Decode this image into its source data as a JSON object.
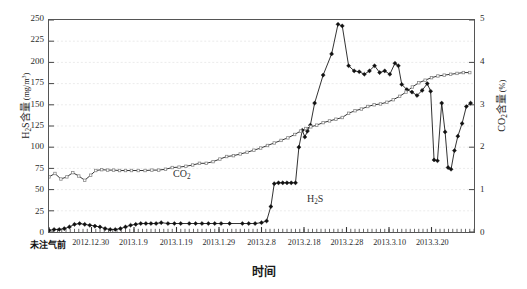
{
  "chart_data": {
    "type": "line",
    "title": "",
    "xlabel": "时间",
    "ylabel": "H₂S含量 (mg/m³)",
    "y2label": "CO₂含量 (%)",
    "grid": true,
    "legend_position": "in-plot-annotation",
    "ylim": [
      0,
      250
    ],
    "y2lim": [
      0,
      5
    ],
    "yticks": [
      0,
      25,
      50,
      75,
      100,
      125,
      150,
      175,
      200,
      225,
      250
    ],
    "y2ticks": [
      0,
      1,
      2,
      3,
      4,
      5
    ],
    "xtick_labels": [
      "未注气前",
      "2012.12.30",
      "2013.1.9",
      "2013.1.19",
      "2013.1.29",
      "2013.2.8",
      "2013.2.18",
      "2013.2.28",
      "2013.3.10",
      "2013.3.20"
    ],
    "xtick_positions": [
      0,
      10,
      20,
      30,
      40,
      50,
      60,
      70,
      80,
      90
    ],
    "x_range": [
      0,
      100
    ],
    "annotations": [
      {
        "text": "CO₂",
        "x": 18,
        "y": 120
      },
      {
        "text": "H₂S",
        "x": 50,
        "y": 60
      }
    ],
    "series": [
      {
        "name": "H₂S",
        "axis": "left",
        "unit": "mg/m³",
        "marker": "diamond-filled",
        "color": "#111111",
        "points": [
          {
            "x": 0.0,
            "y": 2
          },
          {
            "x": 1.2,
            "y": 3
          },
          {
            "x": 2.4,
            "y": 3
          },
          {
            "x": 3.6,
            "y": 4
          },
          {
            "x": 4.8,
            "y": 6
          },
          {
            "x": 6.0,
            "y": 9
          },
          {
            "x": 7.2,
            "y": 10
          },
          {
            "x": 8.4,
            "y": 9
          },
          {
            "x": 9.6,
            "y": 8
          },
          {
            "x": 10.8,
            "y": 7
          },
          {
            "x": 12.0,
            "y": 6
          },
          {
            "x": 13.2,
            "y": 4
          },
          {
            "x": 14.4,
            "y": 3
          },
          {
            "x": 15.6,
            "y": 3
          },
          {
            "x": 16.8,
            "y": 4
          },
          {
            "x": 18.0,
            "y": 6
          },
          {
            "x": 19.2,
            "y": 8
          },
          {
            "x": 20.4,
            "y": 9
          },
          {
            "x": 21.6,
            "y": 10
          },
          {
            "x": 22.8,
            "y": 10
          },
          {
            "x": 24.0,
            "y": 10
          },
          {
            "x": 25.2,
            "y": 10
          },
          {
            "x": 26.4,
            "y": 11
          },
          {
            "x": 28.0,
            "y": 10
          },
          {
            "x": 29.5,
            "y": 10
          },
          {
            "x": 31.0,
            "y": 10
          },
          {
            "x": 33.0,
            "y": 10
          },
          {
            "x": 34.5,
            "y": 10
          },
          {
            "x": 36.0,
            "y": 10
          },
          {
            "x": 37.5,
            "y": 10
          },
          {
            "x": 39.0,
            "y": 10
          },
          {
            "x": 40.5,
            "y": 10
          },
          {
            "x": 42.5,
            "y": 10
          },
          {
            "x": 45.5,
            "y": 10
          },
          {
            "x": 47.0,
            "y": 10
          },
          {
            "x": 48.5,
            "y": 10
          },
          {
            "x": 50.0,
            "y": 11
          },
          {
            "x": 51.2,
            "y": 13
          },
          {
            "x": 52.2,
            "y": 30
          },
          {
            "x": 53.0,
            "y": 57
          },
          {
            "x": 54.0,
            "y": 58
          },
          {
            "x": 55.0,
            "y": 58
          },
          {
            "x": 56.0,
            "y": 58
          },
          {
            "x": 57.0,
            "y": 58
          },
          {
            "x": 58.0,
            "y": 58
          },
          {
            "x": 58.8,
            "y": 100
          },
          {
            "x": 59.6,
            "y": 120
          },
          {
            "x": 60.2,
            "y": 112
          },
          {
            "x": 60.8,
            "y": 119
          },
          {
            "x": 61.5,
            "y": 126
          },
          {
            "x": 62.5,
            "y": 152
          },
          {
            "x": 64.5,
            "y": 185
          },
          {
            "x": 66.5,
            "y": 210
          },
          {
            "x": 68.0,
            "y": 245
          },
          {
            "x": 69.0,
            "y": 243
          },
          {
            "x": 70.5,
            "y": 196
          },
          {
            "x": 71.8,
            "y": 190
          },
          {
            "x": 73.0,
            "y": 189
          },
          {
            "x": 74.2,
            "y": 186
          },
          {
            "x": 75.4,
            "y": 190
          },
          {
            "x": 76.6,
            "y": 196
          },
          {
            "x": 77.8,
            "y": 188
          },
          {
            "x": 79.0,
            "y": 190
          },
          {
            "x": 80.2,
            "y": 186
          },
          {
            "x": 81.4,
            "y": 199
          },
          {
            "x": 82.2,
            "y": 196
          },
          {
            "x": 83.0,
            "y": 174
          },
          {
            "x": 84.2,
            "y": 168
          },
          {
            "x": 85.4,
            "y": 165
          },
          {
            "x": 86.6,
            "y": 161
          },
          {
            "x": 87.8,
            "y": 167
          },
          {
            "x": 89.0,
            "y": 175
          },
          {
            "x": 89.8,
            "y": 166
          },
          {
            "x": 90.6,
            "y": 85
          },
          {
            "x": 91.4,
            "y": 84
          },
          {
            "x": 92.4,
            "y": 152
          },
          {
            "x": 93.2,
            "y": 118
          },
          {
            "x": 93.9,
            "y": 76
          },
          {
            "x": 94.6,
            "y": 74
          },
          {
            "x": 95.4,
            "y": 96
          },
          {
            "x": 96.2,
            "y": 113
          },
          {
            "x": 97.2,
            "y": 128
          },
          {
            "x": 98.2,
            "y": 148
          },
          {
            "x": 99.2,
            "y": 152
          }
        ]
      },
      {
        "name": "CO₂",
        "axis": "right",
        "unit": "%",
        "marker": "square-open",
        "color": "#777777",
        "points": [
          {
            "x": 0.0,
            "y": 1.3
          },
          {
            "x": 1.4,
            "y": 1.38
          },
          {
            "x": 2.8,
            "y": 1.25
          },
          {
            "x": 4.2,
            "y": 1.3
          },
          {
            "x": 5.6,
            "y": 1.4
          },
          {
            "x": 7.0,
            "y": 1.32
          },
          {
            "x": 8.4,
            "y": 1.22
          },
          {
            "x": 9.8,
            "y": 1.34
          },
          {
            "x": 11.0,
            "y": 1.45
          },
          {
            "x": 12.4,
            "y": 1.47
          },
          {
            "x": 13.8,
            "y": 1.46
          },
          {
            "x": 15.2,
            "y": 1.46
          },
          {
            "x": 16.6,
            "y": 1.45
          },
          {
            "x": 18.0,
            "y": 1.45
          },
          {
            "x": 19.4,
            "y": 1.45
          },
          {
            "x": 21.0,
            "y": 1.45
          },
          {
            "x": 22.6,
            "y": 1.45
          },
          {
            "x": 24.2,
            "y": 1.46
          },
          {
            "x": 25.8,
            "y": 1.46
          },
          {
            "x": 27.4,
            "y": 1.48
          },
          {
            "x": 29.0,
            "y": 1.52
          },
          {
            "x": 30.6,
            "y": 1.53
          },
          {
            "x": 32.2,
            "y": 1.55
          },
          {
            "x": 33.8,
            "y": 1.58
          },
          {
            "x": 35.4,
            "y": 1.62
          },
          {
            "x": 37.0,
            "y": 1.62
          },
          {
            "x": 38.6,
            "y": 1.66
          },
          {
            "x": 40.2,
            "y": 1.72
          },
          {
            "x": 41.8,
            "y": 1.78
          },
          {
            "x": 43.4,
            "y": 1.8
          },
          {
            "x": 45.0,
            "y": 1.84
          },
          {
            "x": 46.6,
            "y": 1.88
          },
          {
            "x": 48.2,
            "y": 1.93
          },
          {
            "x": 49.8,
            "y": 1.98
          },
          {
            "x": 51.4,
            "y": 2.04
          },
          {
            "x": 53.0,
            "y": 2.1
          },
          {
            "x": 54.6,
            "y": 2.16
          },
          {
            "x": 56.2,
            "y": 2.22
          },
          {
            "x": 57.8,
            "y": 2.3
          },
          {
            "x": 59.2,
            "y": 2.38
          },
          {
            "x": 60.4,
            "y": 2.44
          },
          {
            "x": 61.6,
            "y": 2.48
          },
          {
            "x": 63.0,
            "y": 2.52
          },
          {
            "x": 64.5,
            "y": 2.58
          },
          {
            "x": 66.0,
            "y": 2.62
          },
          {
            "x": 67.5,
            "y": 2.66
          },
          {
            "x": 69.0,
            "y": 2.7
          },
          {
            "x": 70.5,
            "y": 2.8
          },
          {
            "x": 72.0,
            "y": 2.86
          },
          {
            "x": 73.5,
            "y": 2.9
          },
          {
            "x": 75.0,
            "y": 2.96
          },
          {
            "x": 76.5,
            "y": 3.0
          },
          {
            "x": 78.0,
            "y": 3.02
          },
          {
            "x": 79.5,
            "y": 3.06
          },
          {
            "x": 81.0,
            "y": 3.12
          },
          {
            "x": 82.5,
            "y": 3.2
          },
          {
            "x": 84.0,
            "y": 3.3
          },
          {
            "x": 85.5,
            "y": 3.42
          },
          {
            "x": 87.0,
            "y": 3.52
          },
          {
            "x": 88.5,
            "y": 3.58
          },
          {
            "x": 90.0,
            "y": 3.64
          },
          {
            "x": 91.5,
            "y": 3.68
          },
          {
            "x": 93.0,
            "y": 3.7
          },
          {
            "x": 94.5,
            "y": 3.72
          },
          {
            "x": 96.0,
            "y": 3.74
          },
          {
            "x": 97.5,
            "y": 3.76
          },
          {
            "x": 99.0,
            "y": 3.76
          }
        ]
      }
    ]
  },
  "axes": {
    "left_title_main": "H",
    "left_title_sub": "2",
    "left_title_rest": "S含量",
    "left_title_unit_open": " (mg/m",
    "left_title_unit_sup": "3",
    "left_title_unit_close": ")",
    "right_title_main": "CO",
    "right_title_sub": "2",
    "right_title_rest": "含量",
    "right_title_unit": " (%)",
    "x_title": "时间"
  }
}
